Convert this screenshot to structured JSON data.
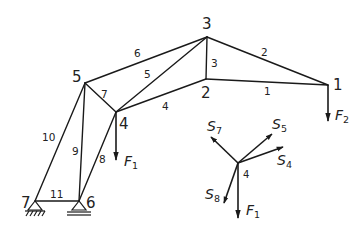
{
  "diagram": {
    "title": "",
    "nodes": [
      {
        "id": "1",
        "label": "1",
        "x": 328,
        "y": 85,
        "lx": 333,
        "ly": 81
      },
      {
        "id": "2",
        "label": "2",
        "x": 206,
        "y": 79,
        "lx": 201,
        "ly": 98
      },
      {
        "id": "3",
        "label": "3",
        "x": 207,
        "y": 37,
        "lx": 201,
        "ly": 28
      },
      {
        "id": "4",
        "label": "4",
        "x": 116,
        "y": 112,
        "lx": 118,
        "ly": 129
      },
      {
        "id": "5",
        "label": "5",
        "x": 85,
        "y": 83,
        "lx": 71,
        "ly": 82
      },
      {
        "id": "6",
        "label": "6",
        "x": 79,
        "y": 201,
        "lx": 85,
        "ly": 208
      },
      {
        "id": "7",
        "label": "7",
        "x": 35,
        "y": 201,
        "lx": 21,
        "ly": 208
      }
    ],
    "members": [
      {
        "id": "1",
        "label": "1",
        "from": "2",
        "to": "1",
        "lx": 266,
        "ly": 94
      },
      {
        "id": "2",
        "label": "2",
        "from": "3",
        "to": "1",
        "lx": 262,
        "ly": 55
      },
      {
        "id": "3",
        "label": "3",
        "from": "3",
        "to": "2",
        "lx": 210,
        "ly": 66
      },
      {
        "id": "4",
        "label": "4",
        "from": "4",
        "to": "2",
        "lx": 163,
        "ly": 110
      },
      {
        "id": "5",
        "label": "5",
        "from": "4",
        "to": "3",
        "lx": 145,
        "ly": 78
      },
      {
        "id": "6",
        "label": "6",
        "from": "5",
        "to": "3",
        "lx": 135,
        "ly": 57
      },
      {
        "id": "7",
        "label": "7",
        "from": "5",
        "to": "4",
        "lx": 101,
        "ly": 97
      },
      {
        "id": "8",
        "label": "8",
        "from": "4",
        "to": "6",
        "lx": 100,
        "ly": 163
      },
      {
        "id": "9",
        "label": "9",
        "from": "5",
        "to": "6",
        "lx": 73,
        "ly": 154
      },
      {
        "id": "10",
        "label": "10",
        "from": "5",
        "to": "7",
        "lx": 43,
        "ly": 141
      },
      {
        "id": "11",
        "label": "11",
        "from": "7",
        "to": "6",
        "lx": 51,
        "ly": 197
      }
    ],
    "supports": [
      {
        "node": "7",
        "type": "fixed-pin"
      },
      {
        "node": "6",
        "type": "roller"
      }
    ],
    "loads": [
      {
        "name": "F",
        "sub": "1",
        "at_node": "4",
        "direction": "down"
      },
      {
        "name": "F",
        "sub": "2",
        "at_node": "1",
        "direction": "down"
      }
    ],
    "labels": {
      "F1_truss": {
        "main": "F",
        "sub": "1"
      },
      "F2_truss": {
        "main": "F",
        "sub": "2"
      }
    },
    "free_body": {
      "node_label": "4",
      "center": {
        "x": 238,
        "y": 163
      },
      "forces": [
        {
          "name": "S",
          "sub": "7",
          "tip": {
            "x": 211,
            "y": 137
          }
        },
        {
          "name": "S",
          "sub": "5",
          "tip": {
            "x": 272,
            "y": 134
          }
        },
        {
          "name": "S",
          "sub": "4",
          "tip": {
            "x": 283,
            "y": 147
          }
        },
        {
          "name": "S",
          "sub": "8",
          "tip": {
            "x": 224,
            "y": 203
          }
        },
        {
          "name": "F",
          "sub": "1",
          "tip": {
            "x": 238,
            "y": 218
          }
        }
      ],
      "labels": {
        "S7": {
          "main": "S",
          "sub": "7"
        },
        "S5": {
          "main": "S",
          "sub": "5"
        },
        "S4": {
          "main": "S",
          "sub": "4"
        },
        "S8": {
          "main": "S",
          "sub": "8"
        },
        "F1": {
          "main": "F",
          "sub": "1"
        }
      }
    }
  }
}
